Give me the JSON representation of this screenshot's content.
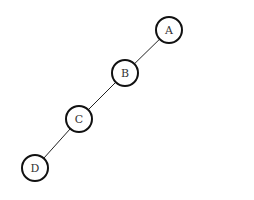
{
  "diagram": {
    "type": "tree",
    "nodes": [
      {
        "id": "A",
        "label": "A"
      },
      {
        "id": "B",
        "label": "B"
      },
      {
        "id": "C",
        "label": "C"
      },
      {
        "id": "D",
        "label": "D"
      }
    ],
    "edges": [
      {
        "from": "A",
        "to": "B"
      },
      {
        "from": "B",
        "to": "C"
      },
      {
        "from": "C",
        "to": "D"
      }
    ]
  }
}
